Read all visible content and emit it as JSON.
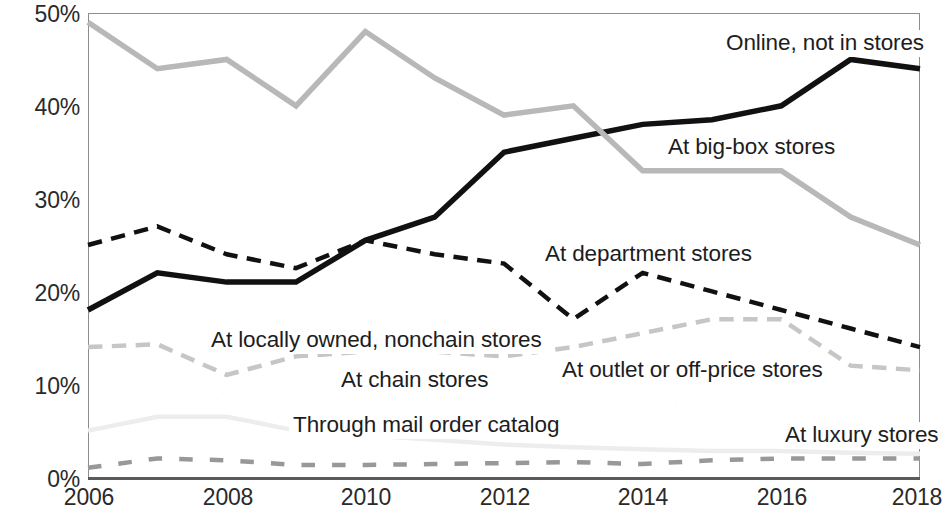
{
  "chart_data": {
    "type": "line",
    "title": "",
    "subtitle": "",
    "xlabel": "",
    "ylabel": "",
    "x": [
      2006,
      2007,
      2008,
      2009,
      2010,
      2011,
      2012,
      2013,
      2014,
      2015,
      2016,
      2017,
      2018
    ],
    "xlim": [
      2006,
      2018
    ],
    "ylim": [
      0,
      50
    ],
    "y_tick_labels": [
      "0%",
      "10%",
      "20%",
      "30%",
      "40%",
      "50%"
    ],
    "y_tick_values": [
      0,
      10,
      20,
      30,
      40,
      50
    ],
    "x_tick_labels": [
      "2006",
      "2008",
      "2010",
      "2012",
      "2014",
      "2016",
      "2018"
    ],
    "x_tick_values": [
      2006,
      2008,
      2010,
      2012,
      2014,
      2016,
      2018
    ],
    "grid": false,
    "legend_position": "inline-annotations",
    "series": [
      {
        "name": "Online, not in stores",
        "color": "#111111",
        "style": "solid",
        "width": 5.5,
        "values": [
          18,
          22,
          21,
          21,
          25.5,
          28,
          35,
          36.5,
          38,
          38.5,
          40,
          45,
          44
        ],
        "label_x": 722,
        "label_y": 30
      },
      {
        "name": "At big-box stores",
        "color": "#b8b8b8",
        "style": "solid",
        "width": 5.5,
        "values": [
          49,
          44,
          45,
          40,
          48,
          43,
          39,
          40,
          33,
          33,
          33,
          28,
          25
        ],
        "label_x": 664,
        "label_y": 134
      },
      {
        "name": "At department stores",
        "color": "#111111",
        "style": "dashed",
        "width": 4.5,
        "values": [
          25,
          27,
          24,
          22.5,
          25.5,
          24,
          23,
          17,
          22,
          20,
          18,
          16,
          14
        ],
        "label_x": 541,
        "label_y": 241
      },
      {
        "name": "At locally owned, nonchain stores",
        "color": "#c6c6c6",
        "style": "dashed",
        "width": 4.5,
        "values": [
          14,
          14.3,
          11,
          13,
          13.5,
          13.5,
          13,
          14,
          15.5,
          17,
          17,
          12,
          11.5
        ],
        "label_x": 207,
        "label_y": 327
      },
      {
        "name": "At chain stores",
        "color": "#111111",
        "style": "dotted",
        "width": 4.5,
        "values": [
          13,
          12,
          9,
          9.5,
          9.5,
          9.5,
          9.5,
          7.5,
          8,
          6,
          5,
          7,
          7
        ],
        "label_x": 337,
        "label_y": 367
      },
      {
        "name": "At outlet or off-price stores",
        "color": "#d8d8d8",
        "style": "dotted",
        "width": 4.5,
        "values": [
          5,
          7,
          5,
          5,
          4.5,
          4,
          3.5,
          3.5,
          4,
          12,
          17,
          11,
          7
        ],
        "label_x": 558,
        "label_y": 357
      },
      {
        "name": "Through mail order catalog",
        "color": "#ededed",
        "style": "solid",
        "width": 4.5,
        "values": [
          5,
          6.5,
          6.5,
          5,
          4.5,
          4,
          3.5,
          3.2,
          3,
          2.8,
          2.8,
          2.6,
          2.5
        ],
        "label_x": 289,
        "label_y": 412
      },
      {
        "name": "At luxury stores",
        "color": "#989898",
        "style": "dashdot",
        "width": 4.5,
        "values": [
          1,
          2,
          1.8,
          1.3,
          1.3,
          1.4,
          1.5,
          1.6,
          1.4,
          1.8,
          2,
          2,
          2
        ],
        "label_x": 781,
        "label_y": 422
      }
    ]
  },
  "axes": {
    "y_labels": [
      "50%",
      "40%",
      "30%",
      "20%",
      "10%",
      "0%"
    ],
    "x_labels": [
      "2006",
      "2008",
      "2010",
      "2012",
      "2014",
      "2016",
      "2018"
    ]
  }
}
